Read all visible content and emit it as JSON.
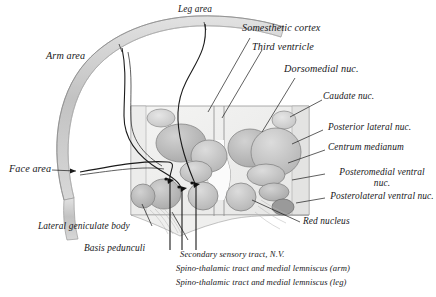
{
  "figure": {
    "background_color": "#ffffff",
    "ink_color": "#17171a",
    "palette": {
      "cortex_band": "#c8c8c8",
      "nucleus_fill": "#b9b9b9",
      "nucleus_fill_light": "#cfcfcf",
      "nucleus_fill_dark": "#a6a6a6",
      "block_fill": "#f1f1f0",
      "outline": "#6e6e6e",
      "marker": "#101010"
    }
  },
  "labels": {
    "leg_area": "Leg area",
    "arm_area": "Arm area",
    "face_area": "Face area",
    "somesthetic_cortex": "Somesthetic cortex",
    "third_ventricle": "Third ventricle",
    "dorsomedial_nuc": "Dorsomedial nuc.",
    "caudate_nuc": "Caudate nuc.",
    "posterior_lateral_nuc": "Posterior lateral nuc.",
    "centrum_medianum": "Centrum medianum",
    "posteromedial_ventral_nuc": "Posteromedial ventral nuc.",
    "posterolateral_ventral_nuc": "Posterolateral ventral nuc.",
    "red_nucleus": "Red nucleus",
    "lateral_geniculate_body": "Lateral geniculate body",
    "basis_pedunculi": "Basis pedunculi",
    "secondary_sensory_tract": "Secondary sensory tract, N.V.",
    "spinothalamic_arm": "Spino-thalamic tract and medial lemniscus (arm)",
    "spinothalamic_leg": "Spino-thalamic tract and medial lemniscus (leg)"
  }
}
